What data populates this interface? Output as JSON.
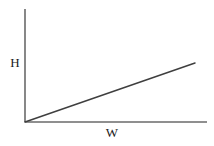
{
  "figure": {
    "name": "linear-relationship-line-graph",
    "background_color": "#ffffff",
    "width": 214,
    "height": 146
  },
  "axes": {
    "y_axis": {
      "label": "H",
      "color": "#6a6a6a",
      "stroke_width": 1.6,
      "x": 25,
      "y_top": 9,
      "y_bottom": 122
    },
    "x_axis": {
      "label": "W",
      "color": "#6a6a6a",
      "stroke_width": 1.6,
      "y": 122,
      "x_left": 25,
      "x_right": 207
    }
  },
  "chart_data": {
    "type": "line",
    "title": "",
    "subtitle": "",
    "xlabel": "W",
    "ylabel": "H",
    "grid": false,
    "legend": null,
    "legend_position": "none",
    "xticks": [],
    "yticks": [],
    "xticklabels": [],
    "yticklabels": [],
    "xlim": [
      0,
      1
    ],
    "ylim": [
      0,
      1
    ],
    "annotations": [],
    "series": [
      {
        "name": "H vs W",
        "color": "#3f3f3f",
        "stroke_width": 1.5,
        "x": [
          0,
          1
        ],
        "y": [
          0,
          0.52
        ],
        "pixel_points": [
          {
            "x": 25,
            "y": 122
          },
          {
            "x": 195,
            "y": 63
          }
        ]
      }
    ]
  }
}
